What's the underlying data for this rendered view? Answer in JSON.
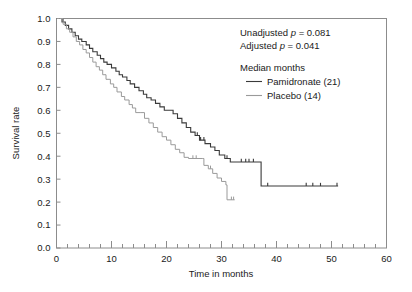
{
  "chart_data": {
    "type": "line",
    "subtype": "kaplan-meier-step",
    "title": "",
    "xlabel": "Time in months",
    "ylabel": "Survival rate",
    "xlim": [
      0,
      60
    ],
    "ylim": [
      0.0,
      1.0
    ],
    "grid": false,
    "frame": "box",
    "x_major_ticks": [
      0,
      10,
      20,
      30,
      40,
      50,
      60
    ],
    "x_minor_tick_step": 2,
    "y_major_ticks": [
      0.0,
      0.1,
      0.2,
      0.3,
      0.4,
      0.5,
      0.6,
      0.7,
      0.8,
      0.9,
      1.0
    ],
    "y_tick_labels": [
      "0.0",
      "0.1",
      "0.2",
      "0.3",
      "0.4",
      "0.5",
      "0.6",
      "0.7",
      "0.8",
      "0.9",
      "1.0"
    ],
    "x_tick_labels": [
      "0",
      "10",
      "20",
      "30",
      "40",
      "50",
      "60"
    ],
    "legend_position": "top-right",
    "series": [
      {
        "name": "Pamidronate",
        "median_months": 21,
        "color": "#3a3a3a",
        "line_width": 1.1,
        "points": [
          [
            0,
            1.0
          ],
          [
            1.0,
            0.985
          ],
          [
            1.6,
            0.97
          ],
          [
            2.2,
            0.955
          ],
          [
            2.8,
            0.94
          ],
          [
            3.4,
            0.925
          ],
          [
            4.0,
            0.91
          ],
          [
            4.6,
            0.9
          ],
          [
            5.4,
            0.885
          ],
          [
            6.0,
            0.87
          ],
          [
            6.6,
            0.855
          ],
          [
            7.4,
            0.84
          ],
          [
            8.0,
            0.825
          ],
          [
            8.6,
            0.81
          ],
          [
            9.2,
            0.8
          ],
          [
            10.0,
            0.785
          ],
          [
            10.8,
            0.77
          ],
          [
            11.4,
            0.755
          ],
          [
            12.0,
            0.745
          ],
          [
            12.8,
            0.73
          ],
          [
            13.4,
            0.715
          ],
          [
            14.2,
            0.7
          ],
          [
            15.0,
            0.685
          ],
          [
            15.8,
            0.67
          ],
          [
            16.4,
            0.655
          ],
          [
            17.2,
            0.645
          ],
          [
            18.0,
            0.63
          ],
          [
            18.8,
            0.615
          ],
          [
            19.6,
            0.6
          ],
          [
            20.4,
            0.6
          ],
          [
            21.2,
            0.585
          ],
          [
            22.0,
            0.565
          ],
          [
            22.8,
            0.545
          ],
          [
            23.6,
            0.525
          ],
          [
            24.4,
            0.505
          ],
          [
            25.2,
            0.49
          ],
          [
            26.0,
            0.47
          ],
          [
            27.0,
            0.455
          ],
          [
            28.0,
            0.44
          ],
          [
            28.8,
            0.425
          ],
          [
            29.6,
            0.405
          ],
          [
            30.6,
            0.39
          ],
          [
            31.6,
            0.375
          ],
          [
            32.6,
            0.375
          ],
          [
            37.0,
            0.375
          ],
          [
            37.2,
            0.27
          ],
          [
            51.2,
            0.27
          ]
        ],
        "censor_marks": [
          [
            1.2,
            0.985
          ],
          [
            25.6,
            0.49
          ],
          [
            26.2,
            0.47
          ],
          [
            26.8,
            0.47
          ],
          [
            31.0,
            0.39
          ],
          [
            33.6,
            0.375
          ],
          [
            34.4,
            0.375
          ],
          [
            35.0,
            0.375
          ],
          [
            35.8,
            0.375
          ],
          [
            38.4,
            0.27
          ],
          [
            45.4,
            0.27
          ],
          [
            46.6,
            0.27
          ],
          [
            48.0,
            0.27
          ],
          [
            51.0,
            0.27
          ]
        ]
      },
      {
        "name": "Placebo",
        "median_months": 14,
        "color": "#9a9a9a",
        "line_width": 1.0,
        "points": [
          [
            0,
            1.0
          ],
          [
            0.6,
            1.0
          ],
          [
            1.2,
            0.975
          ],
          [
            1.8,
            0.955
          ],
          [
            2.4,
            0.94
          ],
          [
            3.0,
            0.92
          ],
          [
            3.6,
            0.9
          ],
          [
            4.2,
            0.885
          ],
          [
            4.8,
            0.865
          ],
          [
            5.4,
            0.85
          ],
          [
            6.0,
            0.83
          ],
          [
            6.6,
            0.81
          ],
          [
            7.2,
            0.79
          ],
          [
            7.8,
            0.775
          ],
          [
            8.4,
            0.755
          ],
          [
            9.0,
            0.735
          ],
          [
            9.8,
            0.715
          ],
          [
            10.4,
            0.7
          ],
          [
            11.0,
            0.68
          ],
          [
            11.8,
            0.66
          ],
          [
            12.4,
            0.645
          ],
          [
            13.2,
            0.625
          ],
          [
            13.8,
            0.61
          ],
          [
            14.4,
            0.59
          ],
          [
            15.2,
            0.59
          ],
          [
            16.0,
            0.565
          ],
          [
            16.8,
            0.545
          ],
          [
            17.6,
            0.525
          ],
          [
            18.4,
            0.505
          ],
          [
            19.2,
            0.485
          ],
          [
            20.0,
            0.47
          ],
          [
            20.8,
            0.45
          ],
          [
            21.6,
            0.43
          ],
          [
            22.4,
            0.415
          ],
          [
            23.2,
            0.395
          ],
          [
            24.0,
            0.39
          ],
          [
            26.6,
            0.39
          ],
          [
            26.8,
            0.36
          ],
          [
            27.6,
            0.345
          ],
          [
            28.4,
            0.325
          ],
          [
            29.2,
            0.305
          ],
          [
            30.0,
            0.29
          ],
          [
            30.8,
            0.275
          ],
          [
            31.0,
            0.21
          ],
          [
            32.4,
            0.21
          ]
        ],
        "censor_marks": [
          [
            24.8,
            0.39
          ],
          [
            25.4,
            0.39
          ],
          [
            28.0,
            0.345
          ],
          [
            31.8,
            0.21
          ],
          [
            32.2,
            0.21
          ]
        ]
      }
    ]
  },
  "annotations": {
    "unadjusted_prefix": "Unadjusted ",
    "unadjusted_p": "p",
    "unadjusted_value": " = 0.081",
    "adjusted_prefix": "Adjusted ",
    "adjusted_p": "p",
    "adjusted_value": " = 0.041"
  },
  "legend": {
    "title": "Median months",
    "entries": [
      {
        "label": "Pamidronate (21)",
        "color": "#3a3a3a"
      },
      {
        "label": "Placebo (14)",
        "color": "#9a9a9a"
      }
    ]
  },
  "colors": {
    "pamidronate": "#3a3a3a",
    "placebo": "#9a9a9a",
    "frame": "#8c8c8c",
    "text": "#1a1a1a",
    "background": "#ffffff"
  }
}
